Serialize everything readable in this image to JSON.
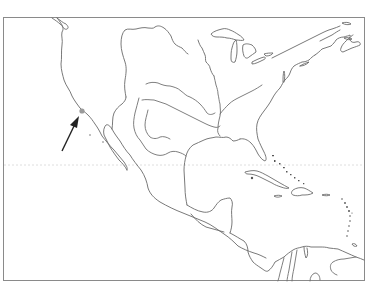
{
  "map": {
    "type": "outline map",
    "region": "North America, Central America, Caribbean and northern South America",
    "labels": [],
    "colors": {
      "background": "#ffffff",
      "outline": "#6a6a6a",
      "frame": "#8a8a8a",
      "arrow": "#222222",
      "marker": "#9a9a9a",
      "tropic_line": "#d6d6d6"
    },
    "frame": {
      "x": 3,
      "y": 17,
      "width": 361,
      "height": 263
    },
    "features": {
      "coastlines": true,
      "great_lakes": true,
      "rivers": [
        "Missouri",
        "Mississippi",
        "Ohio",
        "Arkansas",
        "Red",
        "Rio Grande"
      ],
      "islands": [
        "Cuba",
        "Hispaniola",
        "Jamaica",
        "Puerto Rico",
        "Bahamas",
        "Lesser Antilles"
      ],
      "tropic_of_cancer_dotted_line": true
    },
    "annotation": {
      "type": "arrow",
      "points_to": "Southern California coast",
      "marker": {
        "x": 82,
        "y": 111
      },
      "arrow_tail": {
        "x": 62,
        "y": 150
      },
      "arrow_tip": {
        "x": 78,
        "y": 118
      }
    }
  }
}
